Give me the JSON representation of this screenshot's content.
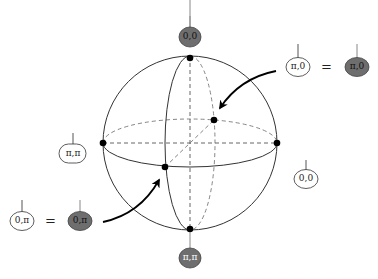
{
  "diagram": {
    "title": "",
    "colors": {
      "line": "#333333",
      "dashed": "#666666",
      "point": "#000000",
      "filled_node": "#6e6e6e",
      "open_node": "#ffffff"
    },
    "sphere": {
      "center": [
        190,
        143
      ],
      "radius": 87,
      "points": [
        "top",
        "bottom",
        "left",
        "right",
        "front",
        "back"
      ]
    },
    "nodes": {
      "top": {
        "label": "0,0",
        "filled": true
      },
      "bottom": {
        "label": "π,π",
        "filled": true
      },
      "left": {
        "label": "π,π",
        "filled": false
      },
      "right": {
        "label": "0,0",
        "filled": false
      },
      "upper_right_open": {
        "label": "π,0",
        "filled": false
      },
      "upper_right_filled": {
        "label": "π,0",
        "filled": true
      },
      "lower_left_open": {
        "label": "0,π",
        "filled": false
      },
      "lower_left_filled": {
        "label": "0,π",
        "filled": true
      }
    },
    "equations": {
      "upper": "=",
      "lower": "="
    }
  }
}
